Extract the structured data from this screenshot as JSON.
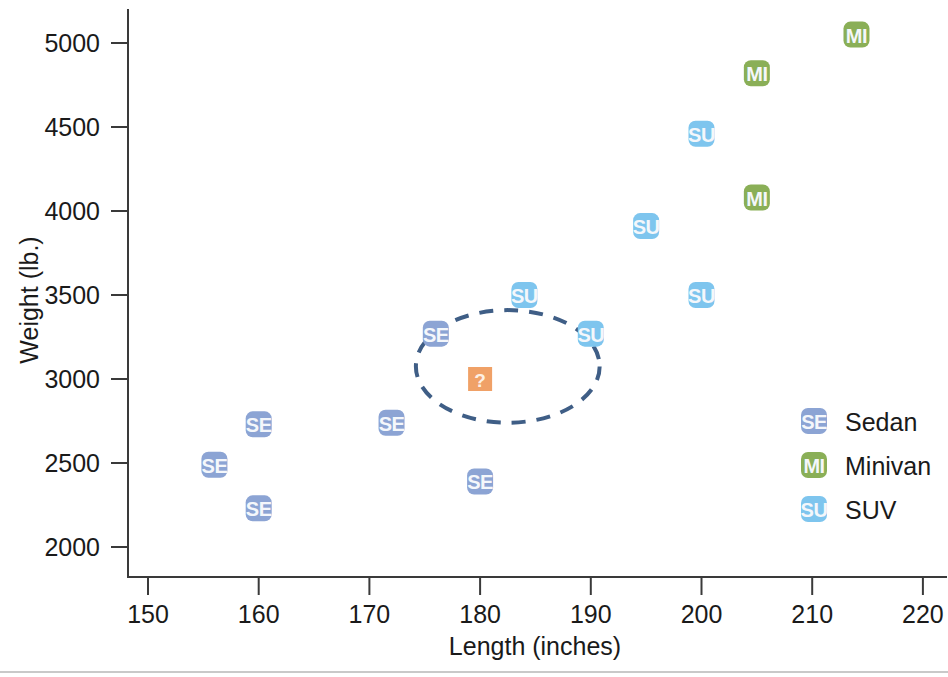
{
  "chart_data": {
    "type": "scatter",
    "title": "",
    "xlabel": "Length (inches)",
    "ylabel": "Weight (lb.)",
    "xlim": [
      145,
      222
    ],
    "ylim": [
      1880,
      5180
    ],
    "xticks": [
      150,
      160,
      170,
      180,
      190,
      200,
      210,
      220
    ],
    "yticks": [
      2000,
      2500,
      3000,
      3500,
      4000,
      4500,
      5000
    ],
    "xtick_labels": [
      "150",
      "160",
      "170",
      "180",
      "190",
      "200",
      "210",
      "220"
    ],
    "ytick_labels": [
      "2000",
      "2500",
      "3000",
      "3500",
      "4000",
      "4500",
      "5000"
    ],
    "grid": false,
    "legend_position": "right-inside",
    "series": [
      {
        "name": "Sedan",
        "marker_label": "SE",
        "color": "#8ca4d4",
        "points": [
          {
            "x": 156,
            "y": 2490,
            "label": "SE"
          },
          {
            "x": 160,
            "y": 2730,
            "label": "SE"
          },
          {
            "x": 160,
            "y": 2230,
            "label": "SE"
          },
          {
            "x": 172,
            "y": 2740,
            "label": "SE"
          },
          {
            "x": 176,
            "y": 3270,
            "label": "SE"
          },
          {
            "x": 180,
            "y": 2390,
            "label": "SE"
          }
        ]
      },
      {
        "name": "Minivan",
        "marker_label": "MI",
        "color": "#8aaf57",
        "points": [
          {
            "x": 205,
            "y": 4080,
            "label": "MI"
          },
          {
            "x": 205,
            "y": 4820,
            "label": "MI"
          },
          {
            "x": 214,
            "y": 5050,
            "label": "MI"
          }
        ]
      },
      {
        "name": "SUV",
        "marker_label": "SU",
        "color": "#7ec5ee",
        "points": [
          {
            "x": 184,
            "y": 3500,
            "label": "SU"
          },
          {
            "x": 190,
            "y": 3270,
            "label": "SU"
          },
          {
            "x": 195,
            "y": 3910,
            "label": "SU"
          },
          {
            "x": 200,
            "y": 3500,
            "label": "SU"
          },
          {
            "x": 200,
            "y": 4460,
            "label": "SU"
          }
        ]
      }
    ],
    "unknown_point": {
      "x": 180,
      "y": 3000,
      "label": "?",
      "color": "#f0a167",
      "shape": "square"
    },
    "annotations": [
      {
        "type": "ellipse",
        "name": "cluster-highlight",
        "center_x": 182.5,
        "center_y": 3075,
        "radius_x": 8.3,
        "radius_y": 335,
        "style": "dashed",
        "color": "#3f5e86"
      }
    ],
    "legend": {
      "entries": [
        {
          "label": "Sedan",
          "marker": "SE",
          "color": "#8ca4d4"
        },
        {
          "label": "Minivan",
          "marker": "MI",
          "color": "#8aaf57"
        },
        {
          "label": "SUV",
          "marker": "SU",
          "color": "#7ec5ee"
        }
      ]
    }
  }
}
